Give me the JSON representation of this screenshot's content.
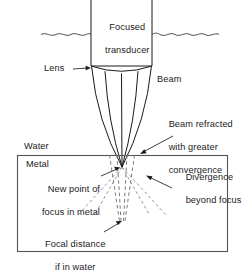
{
  "figure": {
    "kind": "ultrasonic-focused-transducer-refraction-diagram",
    "background_color": "#ffffff",
    "line_color": "#1a1a1a",
    "dashed_line_color": "#7a7a7a",
    "box_border_color": "#555555"
  },
  "labels": {
    "transducer_line1": "Focused",
    "transducer_line2": "transducer",
    "lens": "Lens",
    "beam": "Beam",
    "refracted_line1": "Beam refracted",
    "refracted_line2": "with greater",
    "refracted_line3": "convergence",
    "water": "Water",
    "metal": "Metal",
    "new_focus_line1": "New point of",
    "new_focus_line2": "focus in metal",
    "divergence_line1": "Divergence",
    "divergence_line2": "beyond focus",
    "focal_distance_line1": "Focal distance",
    "focal_distance_line2": "if in water"
  },
  "geometry": {
    "transducer_box": {
      "x": 91,
      "y": 0,
      "width": 61,
      "height": 66
    },
    "water_surface_y": 34,
    "metal_box": {
      "x": 17,
      "y": 155,
      "width": 211,
      "height": 97
    },
    "lens_arc_y": 66,
    "lens_arc_sag": 6,
    "focus_in_metal": {
      "x": 122,
      "y": 167
    },
    "focus_in_water": {
      "x": 122,
      "y": 221
    }
  }
}
